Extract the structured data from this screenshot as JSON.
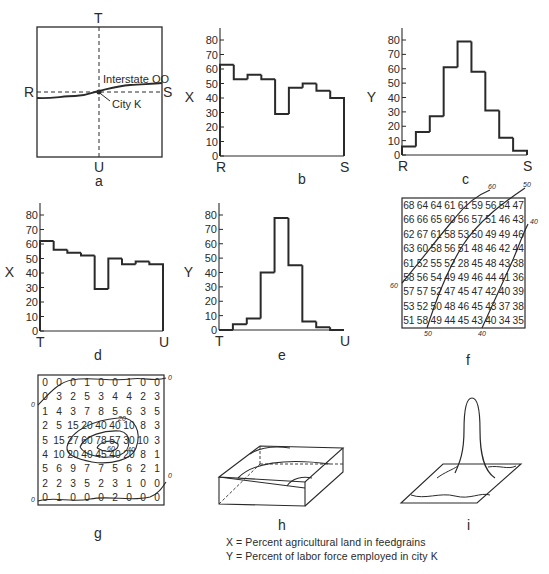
{
  "legend": {
    "x_def": "X = Percent agricultural land in feedgrains",
    "y_def": "Y = Percent of labor force employed in city K"
  },
  "colors": {
    "ink": "#2a2a2a",
    "background": "#ffffff"
  },
  "chart_data": [
    {
      "panel": "a",
      "type": "map",
      "caption": "a",
      "labels": {
        "top": "T",
        "bottom": "U",
        "left": "R",
        "right": "S"
      },
      "road_label": "Interstate OO",
      "city_label": "City K"
    },
    {
      "panel": "b",
      "type": "bar",
      "style": "step-histogram",
      "caption": "b",
      "ylabel": "X",
      "xlabel_start": "R",
      "xlabel_end": "S",
      "ylim": [
        0,
        80
      ],
      "yticks": [
        "0",
        "10",
        "20",
        "30",
        "40",
        "50",
        "60",
        "70",
        "80"
      ],
      "values": [
        63,
        53,
        56,
        53,
        29,
        47,
        50,
        45,
        40
      ]
    },
    {
      "panel": "c",
      "type": "bar",
      "style": "step-histogram",
      "caption": "c",
      "ylabel": "Y",
      "xlabel_start": "R",
      "xlabel_end": "S",
      "ylim": [
        0,
        80
      ],
      "yticks": [
        "0",
        "10",
        "20",
        "30",
        "40",
        "50",
        "60",
        "70",
        "80"
      ],
      "values": [
        6,
        16,
        27,
        61,
        79,
        58,
        31,
        12,
        3
      ]
    },
    {
      "panel": "d",
      "type": "bar",
      "style": "step-histogram",
      "caption": "d",
      "ylabel": "X",
      "xlabel_start": "T",
      "xlabel_end": "U",
      "ylim": [
        0,
        80
      ],
      "yticks": [
        "0",
        "10",
        "20",
        "30",
        "40",
        "50",
        "60",
        "70",
        "80"
      ],
      "values": [
        62,
        56,
        54,
        52,
        29,
        50,
        46,
        48,
        46
      ]
    },
    {
      "panel": "e",
      "type": "bar",
      "style": "step-histogram",
      "caption": "e",
      "ylabel": "Y",
      "xlabel_start": "T",
      "xlabel_end": "U",
      "ylim": [
        0,
        80
      ],
      "yticks": [
        "0",
        "10",
        "20",
        "30",
        "40",
        "50",
        "60",
        "70",
        "80"
      ],
      "values": [
        0,
        4,
        8,
        40,
        78,
        45,
        6,
        2,
        0
      ]
    },
    {
      "panel": "f",
      "type": "table",
      "caption": "f",
      "variable": "X",
      "grid": [
        [
          "68",
          "64",
          "64",
          "61",
          "61",
          "59",
          "56",
          "54",
          "47"
        ],
        [
          "66",
          "66",
          "65",
          "60",
          "56",
          "57",
          "51",
          "46",
          "43"
        ],
        [
          "62",
          "67",
          "61",
          "58",
          "53",
          "50",
          "49",
          "49",
          "46"
        ],
        [
          "63",
          "60",
          "58",
          "56",
          "51",
          "48",
          "46",
          "42",
          "44"
        ],
        [
          "61",
          "52",
          "55",
          "52",
          "28",
          "45",
          "48",
          "43",
          "38"
        ],
        [
          "58",
          "56",
          "54",
          "49",
          "49",
          "46",
          "44",
          "41",
          "36"
        ],
        [
          "57",
          "57",
          "52",
          "47",
          "45",
          "47",
          "42",
          "40",
          "39"
        ],
        [
          "53",
          "52",
          "50",
          "48",
          "46",
          "45",
          "43",
          "37",
          "38"
        ],
        [
          "51",
          "58",
          "49",
          "44",
          "45",
          "43",
          "40",
          "34",
          "35"
        ]
      ],
      "contours": [
        "60",
        "50",
        "40"
      ]
    },
    {
      "panel": "g",
      "type": "table",
      "caption": "g",
      "variable": "Y",
      "grid": [
        [
          "0",
          "0",
          "0",
          "1",
          "0",
          "0",
          "1",
          "0",
          "0"
        ],
        [
          "0",
          "3",
          "2",
          "5",
          "3",
          "4",
          "4",
          "2",
          "3"
        ],
        [
          "1",
          "4",
          "3",
          "7",
          "8",
          "5",
          "6",
          "3",
          "5"
        ],
        [
          "2",
          "5",
          "15",
          "20",
          "40",
          "40",
          "10",
          "8",
          "3"
        ],
        [
          "5",
          "15",
          "27",
          "60",
          "78",
          "57",
          "30",
          "10",
          "3"
        ],
        [
          "4",
          "10",
          "20",
          "40",
          "45",
          "40",
          "20",
          "8",
          "1"
        ],
        [
          "5",
          "6",
          "9",
          "7",
          "7",
          "5",
          "6",
          "2",
          "1"
        ],
        [
          "2",
          "2",
          "3",
          "5",
          "2",
          "3",
          "1",
          "0",
          "0"
        ],
        [
          "0",
          "1",
          "0",
          "0",
          "0",
          "2",
          "0",
          "0",
          "0"
        ]
      ],
      "contours": [
        "0",
        "20",
        "40",
        "60"
      ]
    },
    {
      "panel": "h",
      "type": "diagram",
      "caption": "h",
      "description": "3D surface of X: tilted block sloping down from corner"
    },
    {
      "panel": "i",
      "type": "diagram",
      "caption": "i",
      "description": "3D surface of Y: sharp peak at City K"
    }
  ]
}
